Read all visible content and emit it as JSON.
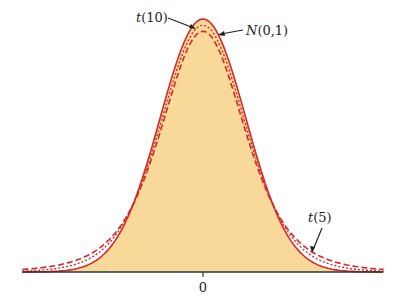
{
  "chart_data": {
    "type": "line",
    "title": "",
    "xlabel": "",
    "ylabel": "",
    "x_ticks": [
      {
        "value": 0,
        "label": "0"
      }
    ],
    "xlim": [
      -4.2,
      4.2
    ],
    "grid": false,
    "legend": "annotations",
    "series": [
      {
        "name": "N(0,1)",
        "distribution": "normal",
        "df": null,
        "style": "solid",
        "fill": true
      },
      {
        "name": "t(10)",
        "distribution": "t",
        "df": 10,
        "style": "dotted",
        "fill": false
      },
      {
        "name": "t(5)",
        "distribution": "t",
        "df": 5,
        "style": "dashed",
        "fill": false
      }
    ],
    "annotations": [
      {
        "text": "t(10)",
        "points_to": "peak of t(10) curve"
      },
      {
        "text": "N(0,1)",
        "points_to": "right shoulder of N(0,1) curve"
      },
      {
        "text": "t(5)",
        "points_to": "right tail of t(5) curve"
      }
    ]
  },
  "colors": {
    "curve": "#d42a2a",
    "fill": "#f8d99a",
    "axis": "#333333",
    "text": "#222222"
  },
  "labels": {
    "t10": "t(10)",
    "normal": "N(0,1)",
    "t5": "t(5)",
    "zero": "0"
  }
}
